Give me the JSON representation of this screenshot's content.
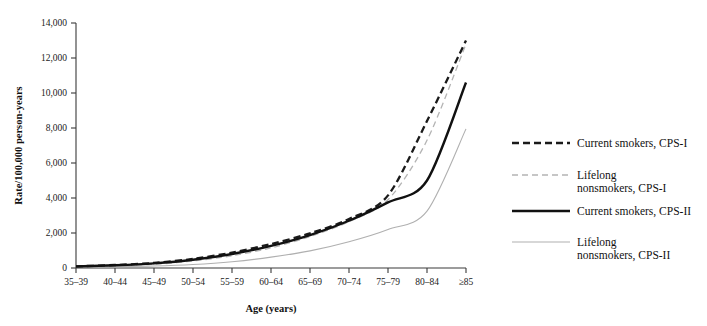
{
  "chart_data": {
    "type": "line",
    "title": "",
    "xlabel": "Age (years)",
    "ylabel": "Rate/100,000 person-years",
    "categories": [
      "35–39",
      "40–44",
      "45–49",
      "50–54",
      "55–59",
      "60–64",
      "65–69",
      "70–74",
      "75–79",
      "80–84",
      "≥85"
    ],
    "ylim": [
      0,
      14000
    ],
    "yticks": [
      0,
      2000,
      4000,
      6000,
      8000,
      10000,
      12000,
      14000
    ],
    "ytick_labels": [
      "0",
      "2,000",
      "4,000",
      "6,000",
      "8,000",
      "10,000",
      "12,000",
      "14,000"
    ],
    "grid": false,
    "legend_position": "right",
    "series": [
      {
        "name": "Current smokers, CPS-I",
        "key": "current-smokers-cps-i",
        "style": "dashed",
        "color": "#1a1a1a",
        "width": 2.3,
        "dash": "7,4",
        "values": [
          95,
          170,
          290,
          520,
          880,
          1370,
          1980,
          2800,
          4150,
          8400,
          13000
        ]
      },
      {
        "name": "Lifelong nonsmokers, CPS-I",
        "key": "lifelong-nonsmokers-cps-i",
        "style": "dashed",
        "color": "#b4b4b4",
        "width": 1.3,
        "dash": "6,4",
        "values": [
          70,
          120,
          210,
          400,
          700,
          1150,
          1800,
          2650,
          3900,
          7300,
          12800
        ]
      },
      {
        "name": "Current smokers, CPS-II",
        "key": "current-smokers-cps-ii",
        "style": "solid",
        "color": "#111111",
        "width": 2.4,
        "dash": "",
        "values": [
          90,
          155,
          265,
          470,
          800,
          1260,
          1880,
          2700,
          3750,
          5000,
          10600
        ]
      },
      {
        "name": "Lifelong nonsmokers, CPS-II",
        "key": "lifelong-nonsmokers-cps-ii",
        "style": "solid",
        "color": "#b0b0b0",
        "width": 1.1,
        "dash": "",
        "values": [
          40,
          65,
          110,
          200,
          360,
          620,
          980,
          1500,
          2200,
          3250,
          7950
        ]
      }
    ]
  },
  "legend": {
    "items": [
      {
        "label_line1": "Current smokers, CPS-I",
        "label_line2": ""
      },
      {
        "label_line1": "Lifelong",
        "label_line2": "nonsmokers, CPS-I"
      },
      {
        "label_line1": "Current smokers, CPS-II",
        "label_line2": ""
      },
      {
        "label_line1": "Lifelong",
        "label_line2": "nonsmokers, CPS-II"
      }
    ]
  }
}
